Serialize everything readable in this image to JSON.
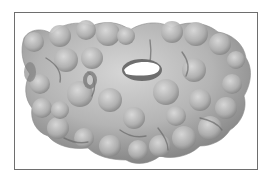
{
  "figure": {
    "caption": "",
    "colors": {
      "background": "#ffffff",
      "frame_border": "#6e6e6e",
      "surface_light": "#d2d2d2",
      "surface_mid": "#a9a9a9",
      "surface_shadow": "#6a6a6a",
      "cavity": "#ffffff"
    }
  }
}
